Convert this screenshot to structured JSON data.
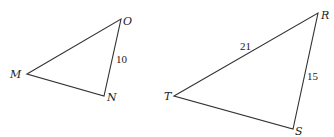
{
  "diagram": {
    "triangles": [
      {
        "name": "MNO",
        "vertices": {
          "M": {
            "label": "M",
            "x": 27,
            "y": 74
          },
          "O": {
            "label": "O",
            "x": 121,
            "y": 19
          },
          "N": {
            "label": "N",
            "x": 104,
            "y": 96
          }
        },
        "side_labels": {
          "ON": "10"
        }
      },
      {
        "name": "TRS",
        "vertices": {
          "T": {
            "label": "T",
            "x": 174,
            "y": 96
          },
          "R": {
            "label": "R",
            "x": 318,
            "y": 13
          },
          "S": {
            "label": "S",
            "x": 293,
            "y": 129
          }
        },
        "side_labels": {
          "TR": "21",
          "RS": "15"
        }
      }
    ],
    "stroke_color": "#333333",
    "background": "#ffffff"
  }
}
